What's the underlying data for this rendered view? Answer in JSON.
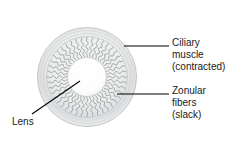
{
  "figure": {
    "background_color": "#ffffff"
  },
  "diagram": {
    "name": "eye-lens-accommodation-diagram",
    "center": {
      "x": 87,
      "y": 77
    },
    "outer_ring": {
      "name": "ciliary-muscle-ring",
      "outer_radius": 50,
      "inner_radius": 41,
      "fill_color": "#e8e9ea",
      "stroke_color": "#b9bcbe"
    },
    "fiber_band": {
      "name": "zonular-fibers-band",
      "outer_radius": 40,
      "inner_radius": 19,
      "fiber_count": 44,
      "stroke_color": "#8e9194",
      "waviness": "slack"
    },
    "lens": {
      "name": "lens-body",
      "radius": 19,
      "fill_color": "#ffffff",
      "stroke_color": "#c9cbcd"
    }
  },
  "labels": [
    {
      "id": "ciliary",
      "name": "label-ciliary-muscle",
      "lines": [
        "Ciliary",
        "muscle",
        "(contracted)"
      ],
      "leader": {
        "name": "leader-line-ciliary-muscle",
        "x1": 124,
        "y1": 46,
        "x2": 169,
        "y2": 46,
        "color": "#000000"
      }
    },
    {
      "id": "zonular",
      "name": "label-zonular-fibers",
      "lines": [
        "Zonular",
        "fibers",
        "(slack)"
      ],
      "leader": {
        "name": "leader-line-zonular-fibers",
        "x1": 117,
        "y1": 94,
        "x2": 169,
        "y2": 94,
        "color": "#000000"
      }
    },
    {
      "id": "lens",
      "name": "label-lens",
      "lines": [
        "Lens"
      ],
      "leader": {
        "name": "leader-line-lens",
        "x1": 32,
        "y1": 114,
        "x2": 80,
        "y2": 81,
        "color": "#000000"
      }
    }
  ],
  "text": {
    "ciliary_line1": "Ciliary",
    "ciliary_line2": "muscle",
    "ciliary_line3": "(contracted)",
    "zonular_line1": "Zonular",
    "zonular_line2": "fibers",
    "zonular_line3": "(slack)",
    "lens_line1": "Lens"
  },
  "colors": {
    "text": "#1a1a1a",
    "leader_line": "#000000",
    "ring_fill": "#e8e9ea",
    "ring_stroke": "#b9bcbe",
    "fiber_stroke": "#8e9194",
    "lens_fill": "#ffffff"
  }
}
